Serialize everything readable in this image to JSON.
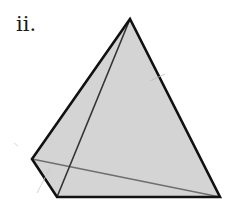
{
  "figure": {
    "label": "ii.",
    "shape": "pyramid (tetrahedron)",
    "colors": {
      "fill": "#d4d4d4",
      "outline": "#111111",
      "inner_edge": "#333333",
      "thin_edge": "#6e6e6e"
    },
    "vertices": {
      "apex": [
        130,
        19
      ],
      "left": [
        32,
        159
      ],
      "bottom_left": [
        57,
        197
      ],
      "bottom_right": [
        220,
        197
      ]
    }
  }
}
